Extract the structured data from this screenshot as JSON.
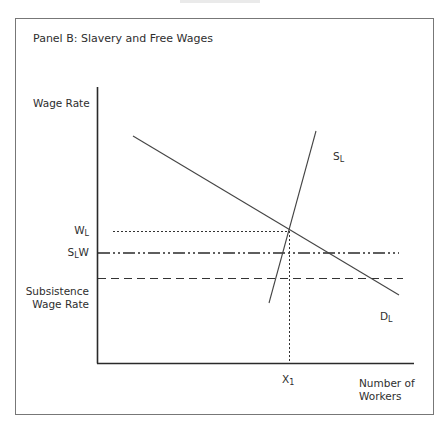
{
  "panel": {
    "title": "Panel B: Slavery and Free Wages"
  },
  "axes": {
    "y_label": "Wage Rate",
    "x_label_line1": "Number of",
    "x_label_line2": "Workers"
  },
  "y_markers": {
    "wl_main": "W",
    "wl_sub": "L",
    "slw_main_s": "S",
    "slw_sub": "L",
    "slw_main_w": "W",
    "subsistence_line1": "Subsistence",
    "subsistence_line2": "Wage Rate"
  },
  "x_markers": {
    "x1_main": "X",
    "x1_sub": "1"
  },
  "curves": {
    "supply_main": "S",
    "supply_sub": "L",
    "demand_main": "D",
    "demand_sub": "L"
  },
  "diagram_model": {
    "description": "Labor market: downward-sloping demand D_L, steep upward-sloping supply S_L; equilibrium at wage W_L and quantity X_1; horizontal reference lines at S_L W (dash-dot) and Subsistence Wage Rate (dashed), both below W_L.",
    "ordering_of_wage_levels_high_to_low": [
      "W_L",
      "S_L W",
      "Subsistence Wage Rate"
    ]
  }
}
